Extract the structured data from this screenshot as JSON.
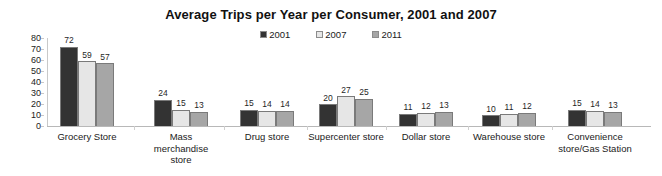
{
  "chart_data": {
    "type": "bar",
    "title": "Average Trips per Year per Consumer, 2001 and 2007",
    "xlabel": "",
    "ylabel": "",
    "ylim": [
      0,
      80
    ],
    "yticks": [
      80,
      70,
      60,
      50,
      40,
      30,
      20,
      10,
      0
    ],
    "grid": false,
    "legend_position": "top-center",
    "categories": [
      "Grocery Store",
      "Mass merchandise store",
      "Drug store",
      "Supercenter store",
      "Dollar store",
      "Warehouse store",
      "Convenience store/Gas Station"
    ],
    "series": [
      {
        "name": "2001",
        "color": "#333333",
        "values": [
          72,
          24,
          15,
          20,
          11,
          10,
          15
        ]
      },
      {
        "name": "2007",
        "color": "#e6e6e6",
        "values": [
          59,
          15,
          14,
          27,
          12,
          11,
          14
        ]
      },
      {
        "name": "2011",
        "color": "#a6a6a6",
        "values": [
          57,
          13,
          14,
          25,
          13,
          12,
          13
        ]
      }
    ]
  },
  "legend": {
    "entries": [
      {
        "label": "2001",
        "color": "#333333"
      },
      {
        "label": "2007",
        "color": "#e6e6e6"
      },
      {
        "label": "2011",
        "color": "#a6a6a6"
      }
    ]
  },
  "axis": {
    "y_tick_labels": [
      "80",
      "70",
      "60",
      "50",
      "40",
      "30",
      "20",
      "10",
      "0"
    ]
  },
  "category_labels": [
    "Grocery Store",
    "Mass\nmerchandise\nstore",
    "Drug store",
    "Supercenter store",
    "Dollar store",
    "Warehouse store",
    "Convenience\nstore/Gas Station"
  ]
}
